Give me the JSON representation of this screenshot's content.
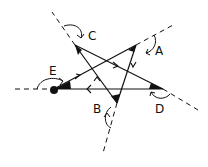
{
  "diagram": {
    "type": "pentagram-exterior-angles",
    "colors": {
      "line": "#111111",
      "background": "#ffffff"
    },
    "vertices": [
      {
        "id": "A",
        "label": "A"
      },
      {
        "id": "B",
        "label": "B"
      },
      {
        "id": "C",
        "label": "C"
      },
      {
        "id": "D",
        "label": "D"
      },
      {
        "id": "E",
        "label": "E"
      }
    ],
    "start_point": "E",
    "path_order": [
      "E",
      "A",
      "B",
      "C",
      "D",
      "E"
    ]
  }
}
